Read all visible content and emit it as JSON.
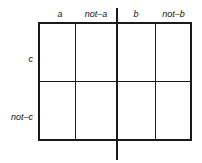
{
  "figure": {
    "name": "four-fold-contingency-grid",
    "background_color": "#ffffff",
    "line_color": "#1a1a1a"
  },
  "columns": [
    {
      "id": "a",
      "label": "a",
      "italic": true
    },
    {
      "id": "not-a",
      "label": "not–a",
      "italic": true
    },
    {
      "id": "b",
      "label": "b",
      "italic": true
    },
    {
      "id": "not-b",
      "label": "not–b",
      "italic": true
    }
  ],
  "rows": [
    {
      "id": "c",
      "label": "c"
    },
    {
      "id": "not-c",
      "label": "not–c"
    }
  ],
  "cells": [
    {
      "row": "c",
      "column": "a",
      "value": ""
    },
    {
      "row": "c",
      "column": "not-a",
      "value": ""
    },
    {
      "row": "c",
      "column": "b",
      "value": ""
    },
    {
      "row": "c",
      "column": "not-b",
      "value": ""
    },
    {
      "row": "not-c",
      "column": "a",
      "value": ""
    },
    {
      "row": "not-c",
      "column": "not-a",
      "value": ""
    },
    {
      "row": "not-c",
      "column": "b",
      "value": ""
    },
    {
      "row": "not-c",
      "column": "not-b",
      "value": ""
    }
  ]
}
